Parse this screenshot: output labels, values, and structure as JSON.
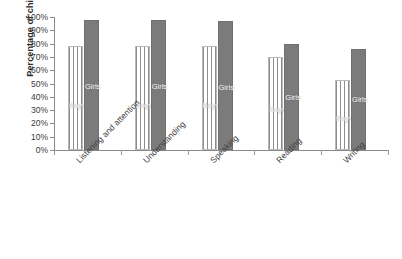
{
  "chart_data": {
    "type": "bar",
    "title": "",
    "xlabel": "",
    "ylabel": "Percentage of children",
    "ylim": [
      0,
      100
    ],
    "grid": false,
    "legend_position": "in-bar-labels",
    "categories": [
      "Listening and attention",
      "Understanding",
      "Speaking",
      "Reading",
      "Writing"
    ],
    "ytick_labels": [
      "0%",
      "10%",
      "20%",
      "30%",
      "40%",
      "50%",
      "60%",
      "70%",
      "80%",
      "90%",
      "100%"
    ],
    "ytick_values": [
      0,
      10,
      20,
      30,
      40,
      50,
      60,
      70,
      80,
      90,
      100
    ],
    "series": [
      {
        "name": "Boys",
        "values": [
          78,
          78,
          78,
          70,
          53
        ],
        "color": "#ffffff",
        "pattern": "vertical-stripes"
      },
      {
        "name": "Girls",
        "values": [
          98,
          98,
          97,
          80,
          76
        ],
        "color": "#7b7b7b",
        "pattern": "solid"
      }
    ]
  },
  "axis": {
    "y_title": "Percentage of children"
  },
  "colors": {
    "boys_fill": "#ffffff",
    "boys_stripe": "#8d8d8d",
    "girls_fill": "#7b7b7b",
    "axis": "#8a8a8a",
    "text": "#3a3a3a",
    "bar_label_text": "#ffffff"
  }
}
